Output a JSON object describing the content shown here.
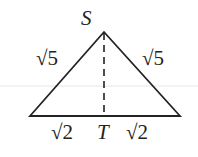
{
  "diagram": {
    "apex_label": "S",
    "foot_label": "T",
    "left_side": "√5",
    "right_side": "√5",
    "base_left": "√2",
    "base_right": "√2",
    "stroke_color": "#222222",
    "guide_line_color": "#e4e4e4"
  }
}
